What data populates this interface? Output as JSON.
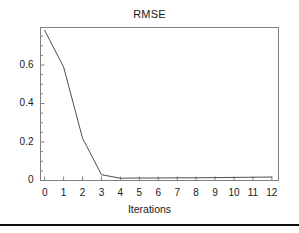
{
  "chart_data": {
    "type": "line",
    "title": "RMSE",
    "xlabel": "Iterations",
    "ylabel": "",
    "x": [
      0,
      1,
      2,
      3,
      4,
      5,
      6,
      7,
      8,
      9,
      10,
      11,
      12
    ],
    "values": [
      0.78,
      0.59,
      0.22,
      0.03,
      0.012,
      0.013,
      0.013,
      0.014,
      0.014,
      0.015,
      0.016,
      0.017,
      0.018
    ],
    "series": [
      {
        "name": "RMSE",
        "values": [
          0.78,
          0.59,
          0.22,
          0.03,
          0.012,
          0.013,
          0.013,
          0.014,
          0.014,
          0.015,
          0.016,
          0.017,
          0.018
        ]
      }
    ],
    "xlim": [
      -0.22,
      12.35
    ],
    "ylim": [
      0,
      0.795
    ],
    "xticks": [
      0,
      1,
      2,
      3,
      4,
      5,
      6,
      7,
      8,
      9,
      10,
      11,
      12
    ],
    "xtick_labels": [
      "0",
      "1",
      "2",
      "3",
      "4",
      "5",
      "6",
      "7",
      "8",
      "9",
      "10",
      "11",
      "12"
    ],
    "yticks": [
      0,
      0.2,
      0.4,
      0.6
    ],
    "ytick_labels": [
      "0",
      "0.2",
      "0.4",
      "0.6"
    ],
    "y_minor_ticks": [
      0.05,
      0.1,
      0.15,
      0.25,
      0.3,
      0.35,
      0.45,
      0.5,
      0.55,
      0.65,
      0.7,
      0.75
    ],
    "grid": false,
    "legend": false,
    "line_color": "#4d4d4d",
    "frame_color": "#808080",
    "text_color": "#1a1a1a"
  }
}
